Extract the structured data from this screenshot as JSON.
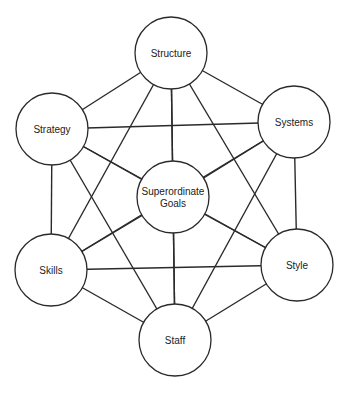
{
  "diagram": {
    "title": "",
    "nodes": [
      {
        "id": "structure",
        "label": "Structure",
        "lines": [
          "Structure"
        ],
        "cx": 171,
        "cy": 53,
        "r": 36
      },
      {
        "id": "strategy",
        "label": "Strategy",
        "lines": [
          "Strategy"
        ],
        "cx": 52,
        "cy": 129,
        "r": 36
      },
      {
        "id": "systems",
        "label": "Systems",
        "lines": [
          "Systems"
        ],
        "cx": 294,
        "cy": 122,
        "r": 36
      },
      {
        "id": "superordinate-goals",
        "label": "Superordinate Goals",
        "lines": [
          "Superordinate",
          "Goals"
        ],
        "cx": 173,
        "cy": 197,
        "r": 36
      },
      {
        "id": "skills",
        "label": "Skills",
        "lines": [
          "Skills"
        ],
        "cx": 51,
        "cy": 270,
        "r": 36
      },
      {
        "id": "style",
        "label": "Style",
        "lines": [
          "Style"
        ],
        "cx": 297,
        "cy": 265,
        "r": 36
      },
      {
        "id": "staff",
        "label": "Staff",
        "lines": [
          "Staff"
        ],
        "cx": 175,
        "cy": 340,
        "r": 36
      }
    ],
    "edges": "all-pairs"
  }
}
